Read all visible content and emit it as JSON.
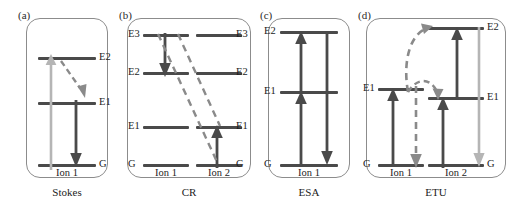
{
  "figure": {
    "width": 518,
    "height": 206,
    "background": "#ffffff",
    "colors": {
      "level_line": "#4a4a4a",
      "arrow_dark": "#4a4a4a",
      "arrow_light": "#b5b5b5",
      "dashed": "#8a8a8a",
      "box_border": "#8c8c8c",
      "text": "#1c1c1c"
    }
  },
  "panels": [
    {
      "tag": "(a)",
      "caption": "Stokes",
      "ions": [
        "Ion 1"
      ],
      "levels": [
        "E2",
        "E1",
        "G"
      ],
      "transitions": [
        {
          "from": "G",
          "to": "E2",
          "style": "solid",
          "color": "light",
          "direction": "up",
          "name": "excitation"
        },
        {
          "from": "E2",
          "to": "E1",
          "style": "dashed",
          "color": "dashed",
          "direction": "down",
          "name": "nonradiative-relaxation"
        },
        {
          "from": "E1",
          "to": "G",
          "style": "solid",
          "color": "dark",
          "direction": "down",
          "name": "emission"
        }
      ]
    },
    {
      "tag": "(b)",
      "caption": "CR",
      "ions": [
        "Ion 1",
        "Ion 2"
      ],
      "levels": [
        "E3",
        "E2",
        "E1",
        "G"
      ],
      "transitions": [
        {
          "ion": "Ion 1",
          "from": "E3",
          "to": "E2",
          "style": "solid",
          "color": "dark",
          "direction": "down",
          "name": "donor-relaxation"
        },
        {
          "ion": "Ion 2",
          "from": "G",
          "to": "E1",
          "style": "solid",
          "color": "dark",
          "direction": "up",
          "name": "acceptor-excitation"
        },
        {
          "from": "Ion 1 E3",
          "to": "Ion 2 G",
          "style": "dashed",
          "color": "dashed",
          "name": "cross-relaxation-1"
        },
        {
          "from": "Ion 1 E2",
          "to": "Ion 2 E1",
          "style": "dashed",
          "color": "dashed",
          "name": "cross-relaxation-2"
        }
      ]
    },
    {
      "tag": "(c)",
      "caption": "ESA",
      "ions": [
        "Ion 1"
      ],
      "levels": [
        "E2",
        "E1",
        "G"
      ],
      "transitions": [
        {
          "from": "G",
          "to": "E1",
          "style": "solid",
          "color": "dark",
          "direction": "up",
          "name": "ground-state-absorption"
        },
        {
          "from": "E1",
          "to": "E2",
          "style": "solid",
          "color": "dark",
          "direction": "up",
          "name": "excited-state-absorption"
        },
        {
          "from": "E2",
          "to": "G",
          "style": "solid",
          "color": "dark",
          "direction": "down",
          "name": "emission"
        }
      ]
    },
    {
      "tag": "(d)",
      "caption": "ETU",
      "ions": [
        "Ion 1",
        "Ion 2"
      ],
      "levels": [
        "E2",
        "E1",
        "G"
      ],
      "transitions": [
        {
          "ion": "Ion 1",
          "from": "G",
          "to": "E1",
          "style": "solid",
          "color": "dark",
          "direction": "up",
          "name": "sensitizer-excitation"
        },
        {
          "ion": "Ion 1",
          "from": "E1",
          "to": "G",
          "style": "dashed",
          "color": "dashed",
          "direction": "down",
          "name": "sensitizer-relaxation"
        },
        {
          "ion": "Ion 2",
          "from": "G",
          "to": "E1",
          "style": "solid",
          "color": "dark",
          "direction": "up",
          "name": "activator-excitation"
        },
        {
          "ion": "Ion 2",
          "from": "E1",
          "to": "E2",
          "style": "solid",
          "color": "dark",
          "direction": "up",
          "name": "activator-upconversion"
        },
        {
          "ion": "Ion 2",
          "from": "E2",
          "to": "G",
          "style": "solid",
          "color": "light",
          "direction": "down",
          "name": "upconverted-emission"
        },
        {
          "from": "Ion 1 E1",
          "to": "Ion 2 E1",
          "style": "dashed-curved",
          "color": "dashed",
          "name": "energy-transfer-1"
        },
        {
          "from": "Ion 1 E1",
          "to": "Ion 2 E2",
          "style": "dashed-curved",
          "color": "dashed",
          "name": "energy-transfer-2"
        }
      ]
    }
  ],
  "labels": {
    "a": {
      "tag": "(a)",
      "caption": "Stokes",
      "ion1": "Ion 1",
      "E2": "E2",
      "E1": "E1",
      "G": "G"
    },
    "b": {
      "tag": "(b)",
      "caption": "CR",
      "ion1": "Ion 1",
      "ion2": "Ion 2",
      "E3_left": "E3",
      "E2_left": "E2",
      "E1_left": "E1",
      "G_left": "G",
      "E3_right": "E3",
      "E2_right": "E2",
      "E1_right": "E1",
      "G_right": "G"
    },
    "c": {
      "tag": "(c)",
      "caption": "ESA",
      "ion1": "Ion 1",
      "E2": "E2",
      "E1": "E1",
      "G": "G"
    },
    "d": {
      "tag": "(d)",
      "caption": "ETU",
      "ion1": "Ion 1",
      "ion2": "Ion 2",
      "E1_left": "E1",
      "G_left": "G",
      "E2_right": "E2",
      "E1_right": "E1",
      "G_right": "G"
    }
  }
}
